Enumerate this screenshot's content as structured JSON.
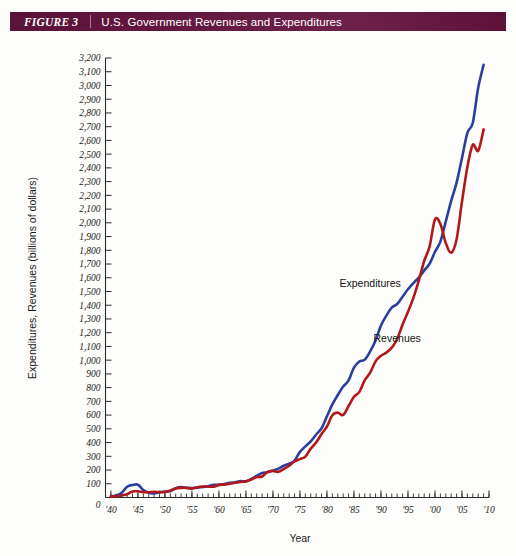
{
  "figure": {
    "tag": "FIGURE 3",
    "title": "U.S. Government Revenues and Expenditures"
  },
  "colors": {
    "band": "#5d1139",
    "expenditures": "#2b3f9e",
    "revenues": "#b0181c",
    "axis": "#2b2b2b",
    "background": "#fdfdfb"
  },
  "chart_data": {
    "type": "line",
    "title": "U.S. Government Revenues and Expenditures",
    "xlabel": "Year",
    "ylabel": "Expenditures, Revenues (billions of dollars)",
    "xlim": [
      1939,
      2010
    ],
    "ylim": [
      0,
      3200
    ],
    "grid": false,
    "legend_position": "inline-annotation",
    "y_ticks": [
      0,
      100,
      200,
      300,
      400,
      500,
      600,
      700,
      800,
      900,
      1000,
      1100,
      1200,
      1300,
      1400,
      1500,
      1600,
      1700,
      1800,
      1900,
      2000,
      2100,
      2200,
      2300,
      2400,
      2500,
      2600,
      2700,
      2800,
      2900,
      3000,
      3100,
      3200
    ],
    "y_tick_labels": [
      "0",
      "100",
      "200",
      "300",
      "400",
      "500",
      "600",
      "700",
      "800",
      "900",
      "1,000",
      "1,100",
      "1,200",
      "1,300",
      "1,400",
      "1,500",
      "1,600",
      "1,700",
      "1,800",
      "1,900",
      "2,000",
      "2,100",
      "2,200",
      "2,300",
      "2,400",
      "2,500",
      "2,600",
      "2,700",
      "2,800",
      "2,900",
      "3,000",
      "3,100",
      "3,200"
    ],
    "x_ticks": [
      1940,
      1945,
      1950,
      1955,
      1960,
      1965,
      1970,
      1975,
      1980,
      1985,
      1990,
      1995,
      2000,
      2005,
      2010
    ],
    "x_tick_labels": [
      "'40",
      "'45",
      "'50",
      "'55",
      "'60",
      "'65",
      "'70",
      "'75",
      "'80",
      "'85",
      "'90",
      "'95",
      "'00",
      "'05",
      "'10"
    ],
    "x_minor_tick_step": 1,
    "annotations": [
      {
        "text": "Expenditures",
        "x": 1988,
        "y": 1530
      },
      {
        "text": "Revenues",
        "x": 1993,
        "y": 1130
      }
    ],
    "x": [
      1940,
      1941,
      1942,
      1943,
      1944,
      1945,
      1946,
      1947,
      1948,
      1949,
      1950,
      1951,
      1952,
      1953,
      1954,
      1955,
      1956,
      1957,
      1958,
      1959,
      1960,
      1961,
      1962,
      1963,
      1964,
      1965,
      1966,
      1967,
      1968,
      1969,
      1970,
      1971,
      1972,
      1973,
      1974,
      1975,
      1976,
      1977,
      1978,
      1979,
      1980,
      1981,
      1982,
      1983,
      1984,
      1985,
      1986,
      1987,
      1988,
      1989,
      1990,
      1991,
      1992,
      1993,
      1994,
      1995,
      1996,
      1997,
      1998,
      1999,
      2000,
      2001,
      2002,
      2003,
      2004,
      2005,
      2006,
      2007,
      2008,
      2009
    ],
    "series": [
      {
        "name": "Expenditures",
        "color": "#2b3f9e",
        "values": [
          9,
          14,
          35,
          78,
          91,
          93,
          55,
          34,
          30,
          39,
          43,
          46,
          68,
          76,
          71,
          68,
          71,
          77,
          82,
          92,
          92,
          98,
          107,
          111,
          119,
          118,
          135,
          157,
          178,
          184,
          196,
          210,
          231,
          246,
          269,
          332,
          372,
          409,
          459,
          504,
          591,
          678,
          746,
          808,
          852,
          946,
          990,
          1004,
          1064,
          1143,
          1253,
          1324,
          1382,
          1409,
          1462,
          1516,
          1561,
          1601,
          1653,
          1702,
          1789,
          1863,
          2011,
          2160,
          2293,
          2472,
          2655,
          2729,
          2983,
          3150
        ]
      },
      {
        "name": "Revenues",
        "color": "#b0181c",
        "values": [
          7,
          9,
          15,
          24,
          44,
          45,
          39,
          38,
          42,
          39,
          39,
          52,
          66,
          70,
          70,
          65,
          75,
          80,
          79,
          79,
          92,
          94,
          100,
          107,
          113,
          117,
          131,
          149,
          153,
          187,
          193,
          187,
          207,
          231,
          263,
          279,
          298,
          356,
          400,
          463,
          517,
          599,
          618,
          601,
          666,
          734,
          769,
          854,
          909,
          991,
          1032,
          1055,
          1091,
          1154,
          1259,
          1352,
          1453,
          1579,
          1722,
          1827,
          2025,
          1991,
          1853,
          1782,
          1880,
          2154,
          2407,
          2568,
          2524,
          2680
        ]
      }
    ]
  }
}
